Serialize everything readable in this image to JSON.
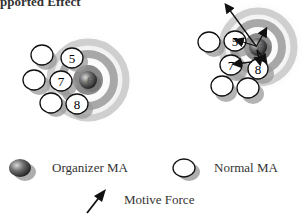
{
  "title": "pported Effect",
  "panels": [
    {
      "name": "before",
      "agents": [
        {
          "id": "blank1",
          "label": ""
        },
        {
          "id": "5",
          "label": "5"
        },
        {
          "id": "blank2",
          "label": ""
        },
        {
          "id": "7",
          "label": "7"
        },
        {
          "id": "6",
          "label": "6",
          "type": "organizer"
        },
        {
          "id": "blank3",
          "label": ""
        },
        {
          "id": "8",
          "label": "8"
        }
      ]
    },
    {
      "name": "after",
      "agents": [
        {
          "id": "blank1",
          "label": ""
        },
        {
          "id": "5",
          "label": "5"
        },
        {
          "id": "6",
          "label": "6",
          "type": "organizer"
        },
        {
          "id": "7",
          "label": "7"
        },
        {
          "id": "8",
          "label": "8"
        },
        {
          "id": "blank2",
          "label": ""
        },
        {
          "id": "blank3",
          "label": ""
        }
      ]
    }
  ],
  "legend": {
    "organizer": "Organizer MA",
    "normal": "Normal MA",
    "force": "Motive Force"
  },
  "colors": {
    "ring_outer": "#e6e6e6",
    "ring_mid": "#bdbdbd",
    "ring_inner": "#8a8a8a",
    "shadow": "#9a9a9a",
    "organizer": "#555555",
    "outline": "#111111"
  }
}
